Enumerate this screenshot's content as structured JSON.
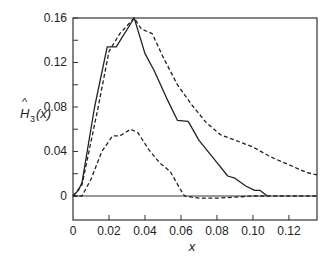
{
  "chart_data": {
    "type": "line",
    "title": "",
    "xlabel": "x",
    "ylabel": "Ĥ3(x)",
    "xlim": [
      0,
      0.1356
    ],
    "ylim": [
      -0.0216,
      0.16
    ],
    "grid": false,
    "legend": null,
    "x_ticks": [
      "0",
      "0.02",
      "0.04",
      "0.06",
      "0.08",
      "0.10",
      "0.12"
    ],
    "x_tick_values": [
      0,
      0.02,
      0.04,
      0.06,
      0.08,
      0.1,
      0.12
    ],
    "y_ticks": [
      "0",
      "0.04",
      "0.08",
      "0.12",
      "0.16"
    ],
    "y_tick_values": [
      0,
      0.04,
      0.08,
      0.12,
      0.16
    ],
    "y_minor_ticks": [
      0.02,
      0.06,
      0.1,
      0.14
    ],
    "x_minor_ticks": [],
    "zero_line": true,
    "series": [
      {
        "name": "estimate (solid)",
        "style": "solid",
        "x": [
          0,
          0.003,
          0.005,
          0.012,
          0.019,
          0.024,
          0.034,
          0.04,
          0.045,
          0.052,
          0.058,
          0.064,
          0.07,
          0.08,
          0.086,
          0.09,
          0.096,
          0.101,
          0.104,
          0.108
        ],
        "y": [
          0,
          0.005,
          0.012,
          0.08,
          0.134,
          0.134,
          0.16,
          0.128,
          0.113,
          0.088,
          0.068,
          0.067,
          0.05,
          0.03,
          0.018,
          0.016,
          0.009,
          0.005,
          0.005,
          0.0
        ]
      },
      {
        "name": "upper band (dashed)",
        "style": "dashed",
        "x": [
          0,
          0.005,
          0.014,
          0.02,
          0.026,
          0.034,
          0.038,
          0.044,
          0.05,
          0.058,
          0.066,
          0.074,
          0.082,
          0.092,
          0.1,
          0.11,
          0.12,
          0.13,
          0.1356
        ],
        "y": [
          0,
          0.01,
          0.08,
          0.13,
          0.146,
          0.16,
          0.15,
          0.146,
          0.125,
          0.1,
          0.082,
          0.066,
          0.055,
          0.049,
          0.044,
          0.035,
          0.028,
          0.021,
          0.019
        ]
      },
      {
        "name": "lower band (dashed)",
        "style": "dashed",
        "x": [
          0,
          0.005,
          0.01,
          0.016,
          0.022,
          0.026,
          0.032,
          0.036,
          0.042,
          0.048,
          0.054,
          0.06,
          0.062,
          0.07,
          0.08,
          0.09,
          0.1,
          0.1356
        ],
        "y": [
          0,
          0.0,
          0.015,
          0.04,
          0.054,
          0.054,
          0.06,
          0.057,
          0.042,
          0.03,
          0.022,
          0.005,
          0.0,
          -0.002,
          -0.002,
          -0.001,
          0.0,
          0.0
        ]
      }
    ]
  },
  "labels": {
    "x_axis": "x",
    "y_axis_main": "H",
    "y_axis_hat": "^",
    "y_axis_sub": "3",
    "y_axis_arg": "(x)"
  },
  "colors": {
    "line": "#222222",
    "axis": "#333333",
    "background": "#ffffff"
  }
}
